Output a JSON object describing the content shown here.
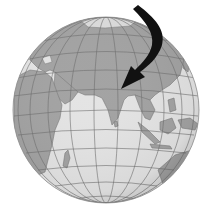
{
  "figure": {
    "annotation": "Curved black arrow pointing to Himalaya region north of India"
  },
  "colors": {
    "background": "#ffffff",
    "ocean": "#e4e4e4",
    "land": "#a3a3a3",
    "ice": "#dcdcdc",
    "grid": "#6e6e6e",
    "border": "#7a7a7a",
    "arrow": "#111111"
  },
  "globe": {
    "cx": 106,
    "cy": 110,
    "r": 93
  }
}
